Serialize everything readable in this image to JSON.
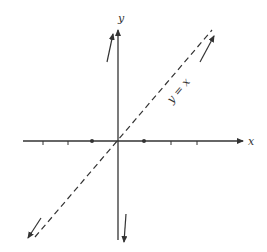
{
  "diagram": {
    "type": "coordinate-plane",
    "axes": {
      "x_label": "x",
      "y_label": "y"
    },
    "line_label": "y = x",
    "line_style": "dashed",
    "marked_points": [
      "(-1, 0)",
      "(1, 0)"
    ],
    "colors": {
      "ink": "#333333",
      "background": "#ffffff"
    }
  }
}
